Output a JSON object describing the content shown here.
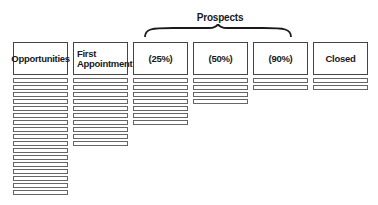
{
  "diagram": {
    "group_label": "Prospects",
    "group_spans": [
      "(25%)",
      "(50%)",
      "(90%)"
    ],
    "colors": {
      "stroke": "#444444",
      "background": "#ffffff",
      "text": "#1a1a1a"
    },
    "columns": [
      {
        "label": "Opportunities",
        "bar_count": 17
      },
      {
        "label": "First Appointment",
        "bar_count": 10
      },
      {
        "label": "(25%)",
        "bar_count": 7
      },
      {
        "label": "(50%)",
        "bar_count": 4
      },
      {
        "label": "(90%)",
        "bar_count": 2
      },
      {
        "label": "Closed",
        "bar_count": 2
      }
    ]
  }
}
